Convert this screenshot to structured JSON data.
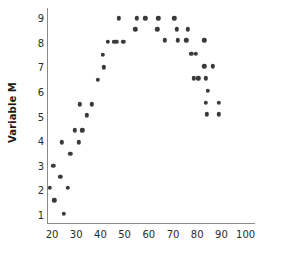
{
  "chart_data": {
    "type": "scatter",
    "title": "",
    "xlabel": "",
    "ylabel": "Variable M",
    "xlim": [
      15,
      103
    ],
    "ylim": [
      0.4,
      9.6
    ],
    "xticks": [
      20,
      30,
      40,
      50,
      60,
      70,
      80,
      90,
      100
    ],
    "yticks": [
      1,
      2,
      3,
      4,
      5,
      6,
      7,
      8,
      9
    ],
    "grid": false,
    "legend": null,
    "marker": {
      "shape": "circle",
      "color": "#3a3a3a",
      "size_px": 4.4
    },
    "axis_color": "#8a8a8a",
    "background": "#ffffff",
    "relationship": "inverted-U (quadratic), peak near x=55-70 at y=9",
    "n_points": 60,
    "points": [
      {
        "x": 19.0,
        "y": 2.1
      },
      {
        "x": 20.5,
        "y": 3.0
      },
      {
        "x": 21.0,
        "y": 1.6
      },
      {
        "x": 23.5,
        "y": 2.55
      },
      {
        "x": 24.0,
        "y": 3.95
      },
      {
        "x": 25.0,
        "y": 1.05
      },
      {
        "x": 26.5,
        "y": 2.1
      },
      {
        "x": 27.5,
        "y": 3.5
      },
      {
        "x": 29.5,
        "y": 4.45
      },
      {
        "x": 31.0,
        "y": 3.95
      },
      {
        "x": 31.5,
        "y": 5.5
      },
      {
        "x": 32.5,
        "y": 4.45
      },
      {
        "x": 34.5,
        "y": 5.05
      },
      {
        "x": 36.5,
        "y": 5.5
      },
      {
        "x": 39.0,
        "y": 6.5
      },
      {
        "x": 41.0,
        "y": 7.5
      },
      {
        "x": 41.5,
        "y": 7.0
      },
      {
        "x": 43.0,
        "y": 8.05
      },
      {
        "x": 45.5,
        "y": 8.05
      },
      {
        "x": 46.5,
        "y": 8.05
      },
      {
        "x": 47.5,
        "y": 9.0
      },
      {
        "x": 49.5,
        "y": 8.05
      },
      {
        "x": 54.5,
        "y": 8.55
      },
      {
        "x": 55.0,
        "y": 9.0
      },
      {
        "x": 58.5,
        "y": 9.0
      },
      {
        "x": 63.5,
        "y": 8.55
      },
      {
        "x": 64.0,
        "y": 9.0
      },
      {
        "x": 66.5,
        "y": 8.1
      },
      {
        "x": 70.5,
        "y": 9.0
      },
      {
        "x": 71.5,
        "y": 8.55
      },
      {
        "x": 72.0,
        "y": 8.1
      },
      {
        "x": 75.5,
        "y": 8.1
      },
      {
        "x": 76.0,
        "y": 8.55
      },
      {
        "x": 77.5,
        "y": 7.55
      },
      {
        "x": 79.5,
        "y": 7.55
      },
      {
        "x": 78.5,
        "y": 6.55
      },
      {
        "x": 80.5,
        "y": 6.55
      },
      {
        "x": 83.0,
        "y": 8.1
      },
      {
        "x": 83.0,
        "y": 7.05
      },
      {
        "x": 83.5,
        "y": 6.55
      },
      {
        "x": 84.5,
        "y": 6.05
      },
      {
        "x": 83.5,
        "y": 5.55
      },
      {
        "x": 84.0,
        "y": 5.1
      },
      {
        "x": 86.5,
        "y": 7.05
      },
      {
        "x": 89.0,
        "y": 5.55
      },
      {
        "x": 89.0,
        "y": 5.1
      }
    ]
  },
  "axis": {
    "ylabel_text": "Variable M",
    "xtick_labels": [
      "20",
      "30",
      "40",
      "50",
      "60",
      "70",
      "80",
      "90",
      "100"
    ],
    "ytick_labels": [
      "1",
      "2",
      "3",
      "4",
      "5",
      "6",
      "7",
      "8",
      "9"
    ]
  }
}
